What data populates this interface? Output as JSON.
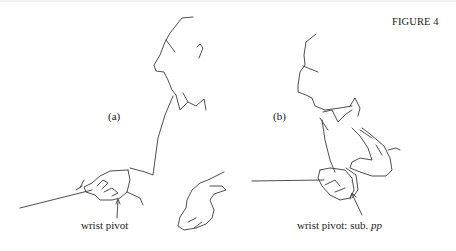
{
  "figure": {
    "title": "FIGURE 4",
    "panels": [
      {
        "label": "(a)",
        "caption": "wrist pivot",
        "subject": "conductor-profile-with-baton"
      },
      {
        "label": "(b)",
        "caption_prefix": "wrist pivot: sub.",
        "caption_dynamic": "pp",
        "subject": "conductor-profile-with-baton-close"
      }
    ],
    "line_color": "#3a3a3a",
    "background": "#ffffff"
  }
}
